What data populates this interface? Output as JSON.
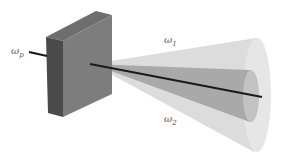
{
  "diagram": {
    "type": "nonlinear-crystal-down-conversion",
    "labels": {
      "pump": {
        "symbol": "ω",
        "subscript": "p"
      },
      "signal": {
        "symbol": "ω",
        "subscript": "1"
      },
      "idler": {
        "symbol": "ω",
        "subscript": "2"
      }
    },
    "colors": {
      "crystal_front": "#4a4a4a",
      "crystal_side": "#7a7a7a",
      "crystal_top": "#6a6a6a",
      "outer_cone": "#d4d4d4",
      "inner_cone": "#a8a8a8",
      "beam": "#1a1a1a"
    }
  }
}
